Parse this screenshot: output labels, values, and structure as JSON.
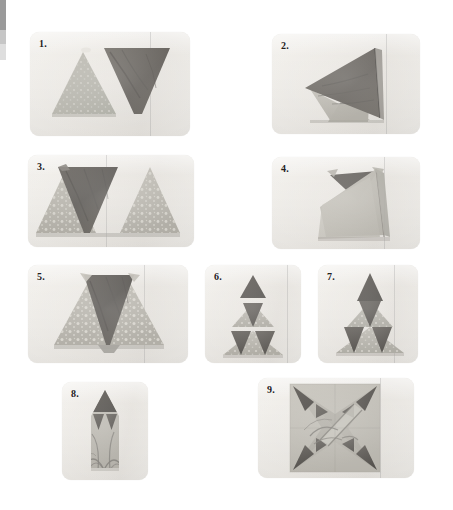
{
  "page": {
    "background_color": "#ffffff",
    "width": 453,
    "height": 510
  },
  "edge_artifact": {
    "dark_color": "#9a9a9a",
    "mid_color": "#c6c6c6",
    "light_color": "#dedede"
  },
  "palette": {
    "photo_background": "#ebe8e3",
    "light_fabric": "#b9b6ae",
    "light_fabric_alt": "#c3c0b8",
    "dark_fabric": "#6d6a65",
    "darker_fabric": "#55524e",
    "shadow": "#a6a39c",
    "label_color": "#24201c"
  },
  "steps": [
    {
      "id": 1,
      "label": "1.",
      "caption_shapes": "light triangle pointing up beside dark triangle pointing down",
      "x": 30,
      "y": 32,
      "w": 160,
      "h": 104
    },
    {
      "id": 2,
      "label": "2.",
      "caption_shapes": "two triangles layered right sides together at an angle",
      "x": 272,
      "y": 34,
      "w": 148,
      "h": 100
    },
    {
      "id": 3,
      "label": "3.",
      "caption_shapes": "pieced row opened flat: dark down triangle between two light up triangles",
      "x": 28,
      "y": 155,
      "w": 166,
      "h": 92
    },
    {
      "id": 4,
      "label": "4.",
      "caption_shapes": "folded pieced unit positioned on angle for next seam",
      "x": 272,
      "y": 157,
      "w": 148,
      "h": 92
    },
    {
      "id": 5,
      "label": "5.",
      "caption_shapes": "large pieced triangle row with dark center triangle",
      "x": 28,
      "y": 265,
      "w": 160,
      "h": 98
    },
    {
      "id": 6,
      "label": "6.",
      "caption_shapes": "three pieced rows stacked, not yet joined",
      "x": 205,
      "y": 265,
      "w": 96,
      "h": 98
    },
    {
      "id": 7,
      "label": "7.",
      "caption_shapes": "rows joined into a tall pieced tree triangle",
      "x": 318,
      "y": 265,
      "w": 100,
      "h": 98
    },
    {
      "id": 8,
      "label": "8.",
      "caption_shapes": "finished kite / point unit on printed background fabric",
      "x": 62,
      "y": 382,
      "w": 86,
      "h": 98
    },
    {
      "id": 9,
      "label": "9.",
      "caption_shapes": "four kite units joined into a four pointed star block",
      "x": 258,
      "y": 378,
      "w": 156,
      "h": 100
    }
  ]
}
